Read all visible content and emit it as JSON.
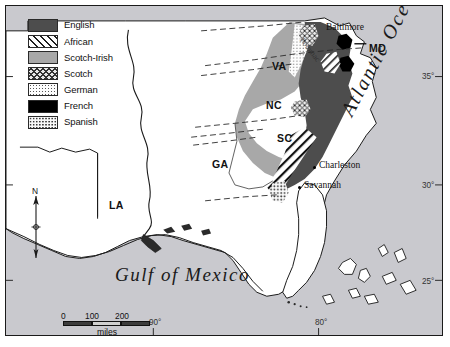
{
  "map": {
    "title_visible": false,
    "legend": {
      "name": "ethnic-groups-legend",
      "items": [
        {
          "label": "English",
          "pattern": "solid-dark-gray",
          "color": "#4d4d4d"
        },
        {
          "label": "African",
          "pattern": "diagonal-hatch",
          "color": "#ffffff"
        },
        {
          "label": "Scotch-Irish",
          "pattern": "solid-mid-gray",
          "color": "#a8a8a8"
        },
        {
          "label": "Scotch",
          "pattern": "cross-hatch",
          "color": "#e8e8e8"
        },
        {
          "label": "German",
          "pattern": "fine-stipple",
          "color": "#fdfdfd"
        },
        {
          "label": "French",
          "pattern": "solid-black",
          "color": "#000000"
        },
        {
          "label": "Spanish",
          "pattern": "coarse-stipple",
          "color": "#fafafa"
        }
      ]
    },
    "water_labels": [
      {
        "name": "atlantic-ocean-label",
        "text": "Atlantic Ocean"
      },
      {
        "name": "gulf-of-mexico-label",
        "text": "Gulf of Mexico"
      },
      {
        "name": "potomac-river-label",
        "text": "Potomac"
      }
    ],
    "state_labels": [
      {
        "name": "state-label-md",
        "text": "MD",
        "x": 368,
        "y": 42
      },
      {
        "name": "state-label-va",
        "text": "VA",
        "x": 270,
        "y": 60
      },
      {
        "name": "state-label-nc",
        "text": "NC",
        "x": 264,
        "y": 99
      },
      {
        "name": "state-label-sc",
        "text": "SC",
        "x": 275,
        "y": 132
      },
      {
        "name": "state-label-ga",
        "text": "GA",
        "x": 211,
        "y": 158
      },
      {
        "name": "state-label-la",
        "text": "LA",
        "x": 108,
        "y": 199
      }
    ],
    "city_labels": [
      {
        "name": "city-label-baltimore",
        "text": "Baltimore",
        "x": 327,
        "y": 21,
        "dot_x": 343,
        "dot_y": 33
      },
      {
        "name": "city-label-charleston",
        "text": "Charleston",
        "x": 314,
        "y": 158,
        "dot_x": 308,
        "dot_y": 163
      },
      {
        "name": "city-label-savannah",
        "text": "Savannah",
        "x": 298,
        "y": 178,
        "dot_x": 293,
        "dot_y": 182
      }
    ],
    "latitude_labels": [
      {
        "name": "lat-label-35",
        "text": "35°",
        "y": 76
      },
      {
        "name": "lat-label-30",
        "text": "30°",
        "y": 185
      },
      {
        "name": "lat-label-25",
        "text": "25°",
        "y": 281
      }
    ],
    "longitude_labels": [
      {
        "name": "lon-label-90",
        "text": "90°",
        "x": 153
      },
      {
        "name": "lon-label-80",
        "text": "80°",
        "x": 319
      }
    ],
    "scale_bar": {
      "name": "scale-bar",
      "ticks": [
        "0",
        "100",
        "200"
      ],
      "unit": "miles"
    },
    "compass": {
      "name": "compass-rose",
      "label": "N"
    },
    "colors": {
      "ocean": "#c9c9ce",
      "land": "#ffffff",
      "english": "#4d4d4d",
      "scotch_irish": "#a8a8a8",
      "french": "#000000",
      "outline": "#1a1a1a"
    }
  }
}
